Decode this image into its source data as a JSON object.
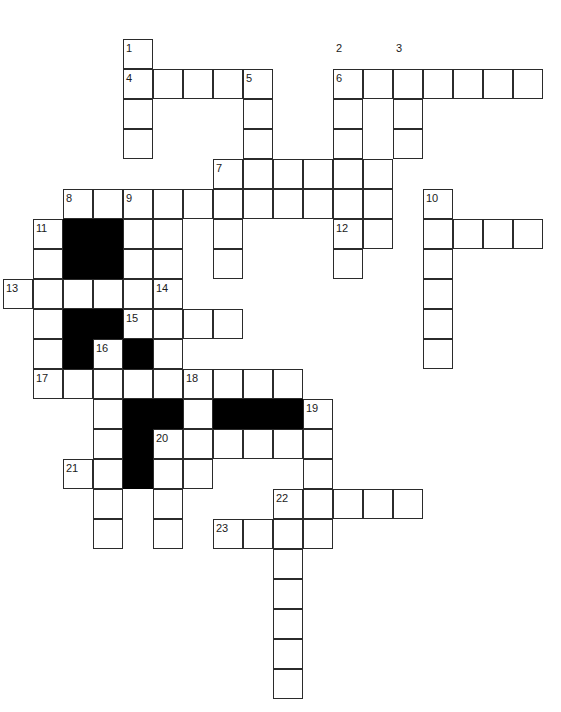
{
  "puzzle": {
    "type": "crossword-grid",
    "title": "Crossword puzzle grid",
    "cell_size": 30,
    "origin": {
      "x": 3,
      "y": 39
    },
    "columns": 19,
    "rows": 23,
    "colors": {
      "background": "#ffffff",
      "cell_fill": "#ffffff",
      "cell_border": "#2b2b2b",
      "block_fill": "#000000",
      "number_text": "#1a1a1a"
    },
    "white_cells": [
      [
        4,
        0
      ],
      [
        4,
        1
      ],
      [
        5,
        1
      ],
      [
        6,
        1
      ],
      [
        7,
        1
      ],
      [
        8,
        1
      ],
      [
        11,
        1
      ],
      [
        12,
        1
      ],
      [
        13,
        1
      ],
      [
        14,
        1
      ],
      [
        15,
        1
      ],
      [
        16,
        1
      ],
      [
        17,
        1
      ],
      [
        4,
        2
      ],
      [
        8,
        2
      ],
      [
        11,
        2
      ],
      [
        13,
        2
      ],
      [
        4,
        3
      ],
      [
        8,
        3
      ],
      [
        11,
        3
      ],
      [
        13,
        3
      ],
      [
        7,
        4
      ],
      [
        8,
        4
      ],
      [
        9,
        4
      ],
      [
        10,
        4
      ],
      [
        11,
        4
      ],
      [
        12,
        4
      ],
      [
        2,
        5
      ],
      [
        3,
        5
      ],
      [
        4,
        5
      ],
      [
        5,
        5
      ],
      [
        6,
        5
      ],
      [
        7,
        5
      ],
      [
        8,
        5
      ],
      [
        9,
        5
      ],
      [
        10,
        5
      ],
      [
        11,
        5
      ],
      [
        12,
        5
      ],
      [
        14,
        5
      ],
      [
        1,
        6
      ],
      [
        2,
        6
      ],
      [
        3,
        6
      ],
      [
        4,
        6
      ],
      [
        5,
        6
      ],
      [
        7,
        6
      ],
      [
        11,
        6
      ],
      [
        12,
        6
      ],
      [
        14,
        6
      ],
      [
        15,
        6
      ],
      [
        16,
        6
      ],
      [
        17,
        6
      ],
      [
        1,
        7
      ],
      [
        2,
        7
      ],
      [
        3,
        7
      ],
      [
        4,
        7
      ],
      [
        5,
        7
      ],
      [
        7,
        7
      ],
      [
        11,
        7
      ],
      [
        14,
        7
      ],
      [
        0,
        8
      ],
      [
        1,
        8
      ],
      [
        2,
        8
      ],
      [
        3,
        8
      ],
      [
        4,
        8
      ],
      [
        5,
        8
      ],
      [
        14,
        8
      ],
      [
        1,
        9
      ],
      [
        2,
        9
      ],
      [
        3,
        9
      ],
      [
        4,
        9
      ],
      [
        5,
        9
      ],
      [
        6,
        9
      ],
      [
        7,
        9
      ],
      [
        14,
        9
      ],
      [
        1,
        10
      ],
      [
        2,
        10
      ],
      [
        3,
        10
      ],
      [
        4,
        10
      ],
      [
        5,
        10
      ],
      [
        14,
        10
      ],
      [
        1,
        11
      ],
      [
        2,
        11
      ],
      [
        3,
        11
      ],
      [
        4,
        11
      ],
      [
        5,
        11
      ],
      [
        6,
        11
      ],
      [
        7,
        11
      ],
      [
        8,
        11
      ],
      [
        9,
        11
      ],
      [
        3,
        12
      ],
      [
        4,
        12
      ],
      [
        5,
        12
      ],
      [
        6,
        12
      ],
      [
        7,
        12
      ],
      [
        8,
        12
      ],
      [
        9,
        12
      ],
      [
        10,
        12
      ],
      [
        3,
        13
      ],
      [
        4,
        13
      ],
      [
        5,
        13
      ],
      [
        6,
        13
      ],
      [
        7,
        13
      ],
      [
        8,
        13
      ],
      [
        9,
        13
      ],
      [
        10,
        13
      ],
      [
        2,
        14
      ],
      [
        3,
        14
      ],
      [
        4,
        14
      ],
      [
        5,
        14
      ],
      [
        6,
        14
      ],
      [
        10,
        14
      ],
      [
        3,
        15
      ],
      [
        5,
        15
      ],
      [
        9,
        15
      ],
      [
        10,
        15
      ],
      [
        11,
        15
      ],
      [
        12,
        15
      ],
      [
        13,
        15
      ],
      [
        3,
        16
      ],
      [
        5,
        16
      ],
      [
        7,
        16
      ],
      [
        8,
        16
      ],
      [
        9,
        16
      ],
      [
        10,
        16
      ],
      [
        9,
        17
      ],
      [
        9,
        18
      ],
      [
        9,
        19
      ],
      [
        9,
        20
      ],
      [
        9,
        21
      ]
    ],
    "black_cells": [
      [
        2,
        6
      ],
      [
        3,
        6
      ],
      [
        2,
        7
      ],
      [
        3,
        7
      ],
      [
        2,
        9
      ],
      [
        3,
        9
      ],
      [
        2,
        10
      ],
      [
        4,
        10
      ],
      [
        4,
        12
      ],
      [
        5,
        12
      ],
      [
        7,
        12
      ],
      [
        8,
        12
      ],
      [
        9,
        12
      ],
      [
        4,
        13
      ],
      [
        4,
        14
      ]
    ],
    "numbers": [
      {
        "label": "1",
        "col": 4,
        "row": 0
      },
      {
        "label": "2",
        "col": 11,
        "row": 0
      },
      {
        "label": "3",
        "col": 13,
        "row": 0
      },
      {
        "label": "4",
        "col": 4,
        "row": 1
      },
      {
        "label": "5",
        "col": 8,
        "row": 1
      },
      {
        "label": "6",
        "col": 11,
        "row": 1
      },
      {
        "label": "7",
        "col": 7,
        "row": 4
      },
      {
        "label": "8",
        "col": 2,
        "row": 5
      },
      {
        "label": "9",
        "col": 4,
        "row": 5
      },
      {
        "label": "10",
        "col": 14,
        "row": 5
      },
      {
        "label": "11",
        "col": 1,
        "row": 6
      },
      {
        "label": "12",
        "col": 11,
        "row": 6
      },
      {
        "label": "13",
        "col": 0,
        "row": 8
      },
      {
        "label": "14",
        "col": 5,
        "row": 8
      },
      {
        "label": "15",
        "col": 4,
        "row": 9
      },
      {
        "label": "16",
        "col": 3,
        "row": 10
      },
      {
        "label": "17",
        "col": 1,
        "row": 11
      },
      {
        "label": "18",
        "col": 6,
        "row": 11
      },
      {
        "label": "19",
        "col": 10,
        "row": 12
      },
      {
        "label": "20",
        "col": 5,
        "row": 13
      },
      {
        "label": "21",
        "col": 2,
        "row": 14
      },
      {
        "label": "22",
        "col": 9,
        "row": 15
      },
      {
        "label": "23",
        "col": 7,
        "row": 16
      }
    ]
  }
}
